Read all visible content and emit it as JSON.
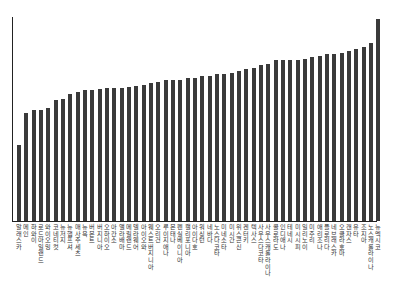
{
  "chart_data": {
    "type": "bar",
    "title": "",
    "xlabel": "",
    "ylabel": "",
    "grid": false,
    "legend": null,
    "categories": [
      "알래스카",
      "메인",
      "하와이",
      "로드아일랜드",
      "와이오밍",
      "코네티컷",
      "뉴저지",
      "뉴햄프셔",
      "매사추세츠",
      "뉴욕",
      "버몬트",
      "버지니아",
      "오하이오",
      "아칸소",
      "앨라배마",
      "메릴랜드",
      "델라웨어",
      "아이오와",
      "웨스트버지니아",
      "오리건",
      "루이지애나",
      "몬태나",
      "펜실베이니아",
      "캘리포니아",
      "아이다호",
      "워싱턴",
      "네바다",
      "노스다코타",
      "미네소타",
      "미시간",
      "위스콘신",
      "켄터키",
      "텍사스",
      "사우스다코타",
      "사우스캐롤라이나",
      "콜로라도",
      "인디애나",
      "테네시",
      "미시시피",
      "일리노이",
      "미주리",
      "애리조나",
      "플로리다",
      "네브래스카",
      "오클라호마",
      "캔자스",
      "유타",
      "조지아",
      "노스캐롤라이나",
      "뉴멕시코"
    ],
    "values": [
      76,
      108,
      111,
      111,
      113,
      121,
      122,
      127,
      129,
      131,
      131,
      132,
      133,
      133,
      133,
      134,
      135,
      136,
      138,
      139,
      141,
      141,
      141,
      143,
      143,
      145,
      145,
      147,
      147,
      148,
      150,
      152,
      153,
      156,
      157,
      161,
      161,
      161,
      161,
      162,
      164,
      165,
      167,
      167,
      168,
      170,
      172,
      174,
      178,
      202
    ],
    "ylim": [
      0,
      205
    ]
  }
}
